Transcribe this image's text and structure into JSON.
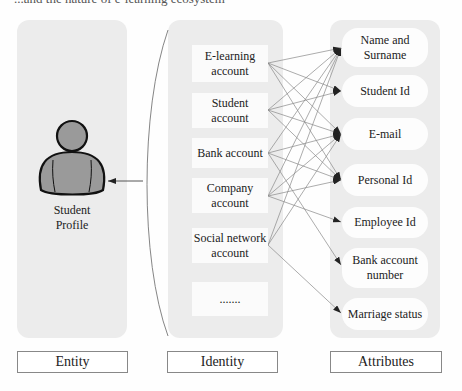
{
  "caption": "...and the nature of e-learning ecosystem",
  "entity": {
    "title": "Entity",
    "figure_icon": "person-icon",
    "figure_label_line1": "Student",
    "figure_label_line2": "Profile"
  },
  "identity": {
    "title": "Identity",
    "items": [
      {
        "line1": "E-learning",
        "line2": "account"
      },
      {
        "line1": "Student",
        "line2": "account"
      },
      {
        "line1": "Bank account",
        "line2": ""
      },
      {
        "line1": "Company",
        "line2": "account"
      },
      {
        "line1": "Social network",
        "line2": "account"
      },
      {
        "line1": ".......",
        "line2": ""
      }
    ]
  },
  "attributes": {
    "title": "Attributes",
    "items": [
      {
        "line1": "Name and",
        "line2": "Surname"
      },
      {
        "line1": "Student Id",
        "line2": ""
      },
      {
        "line1": "E-mail",
        "line2": ""
      },
      {
        "line1": "Personal Id",
        "line2": ""
      },
      {
        "line1": "Employee Id",
        "line2": ""
      },
      {
        "line1": "Bank account",
        "line2": "number"
      },
      {
        "line1": "Marriage status",
        "line2": ""
      }
    ]
  },
  "edges": [
    [
      "E-learning account",
      "Name and Surname"
    ],
    [
      "E-learning account",
      "Student Id"
    ],
    [
      "E-learning account",
      "E-mail"
    ],
    [
      "E-learning account",
      "Personal Id"
    ],
    [
      "Student account",
      "Name and Surname"
    ],
    [
      "Student account",
      "Student Id"
    ],
    [
      "Student account",
      "E-mail"
    ],
    [
      "Student account",
      "Personal Id"
    ],
    [
      "Bank account",
      "Name and Surname"
    ],
    [
      "Bank account",
      "E-mail"
    ],
    [
      "Bank account",
      "Personal Id"
    ],
    [
      "Bank account",
      "Bank account number"
    ],
    [
      "Company account",
      "Name and Surname"
    ],
    [
      "Company account",
      "E-mail"
    ],
    [
      "Company account",
      "Personal Id"
    ],
    [
      "Company account",
      "Employee Id"
    ],
    [
      "Social network account",
      "Name and Surname"
    ],
    [
      "Social network account",
      "E-mail"
    ],
    [
      "Social network account",
      "Marriage status"
    ]
  ]
}
